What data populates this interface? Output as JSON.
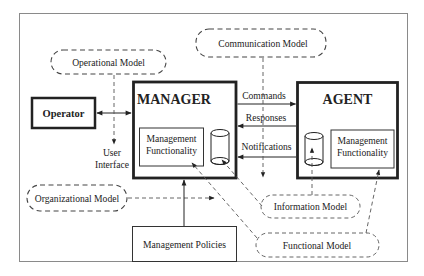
{
  "diagram": {
    "frame": {
      "border_color": "#7a7a7a"
    },
    "nodes": {
      "operator": {
        "label": "Operator"
      },
      "manager": {
        "label": "MANAGER",
        "functionality": {
          "line1": "Management",
          "line2": "Functionality"
        }
      },
      "agent": {
        "label": "AGENT",
        "functionality": {
          "line1": "Management",
          "line2": "Functionality"
        }
      },
      "management_policies": {
        "label": "Management Policies"
      },
      "user_interface": {
        "line1": "User",
        "line2": "Interface"
      }
    },
    "models": {
      "operational": {
        "label": "Operational Model"
      },
      "communication": {
        "label": "Communication Model"
      },
      "organizational": {
        "label": "Organizational Model"
      },
      "information": {
        "label": "Information Model"
      },
      "functional": {
        "label": "Functional Model"
      }
    },
    "messages": {
      "commands": {
        "label": "Commands",
        "direction": "manager-to-agent"
      },
      "responses": {
        "label": "Responses",
        "direction": "agent-to-manager"
      },
      "notifications": {
        "label": "Notifications",
        "direction": "agent-to-manager"
      }
    }
  }
}
